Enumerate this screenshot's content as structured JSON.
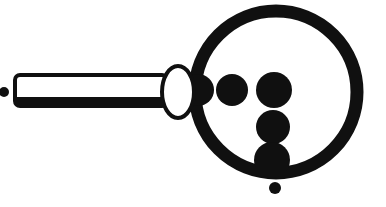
{
  "figure": {
    "alt_text": "Black and white line drawing of a magnifying glass whose lens contains six solid dots",
    "background_color": "#ffffff",
    "ink_color": "#101010",
    "canvas": {
      "width": 386,
      "height": 207
    },
    "style": "monochrome-line-art"
  },
  "lens": {
    "name": "lens-ring",
    "center_x": 276,
    "center_y": 92,
    "radius": 81,
    "stroke_width": 13,
    "fill": "none"
  },
  "ferrule": {
    "name": "ferrule-ellipse",
    "center_x": 178,
    "center_y": 92,
    "radius_x": 16,
    "radius_y": 26,
    "stroke_width": 4,
    "fill": "#ffffff"
  },
  "handle": {
    "name": "handle-bar",
    "x": 15,
    "y": 75,
    "width": 152,
    "height": 31,
    "top_stroke_width": 4,
    "bottom_stroke_width": 9,
    "fill": "#ffffff",
    "corner_radius": 5
  },
  "tip_dot": {
    "name": "handle-tip-dot",
    "center_x": 4,
    "center_y": 92,
    "radius": 5
  },
  "dots": [
    {
      "id": "dot-row-1",
      "label": "Dot 1",
      "cx": 198,
      "cy": 90,
      "r": 16
    },
    {
      "id": "dot-row-2",
      "label": "Dot 2",
      "cx": 232,
      "cy": 90,
      "r": 16
    },
    {
      "id": "dot-row-3",
      "label": "Dot 3",
      "cx": 274,
      "cy": 90,
      "r": 18
    },
    {
      "id": "dot-col-2",
      "label": "Dot 4",
      "cx": 273,
      "cy": 127,
      "r": 17
    },
    {
      "id": "dot-col-3",
      "label": "Dot 5",
      "cx": 272,
      "cy": 160,
      "r": 18
    },
    {
      "id": "dot-outside",
      "label": "Dot 6",
      "cx": 275,
      "cy": 188,
      "r": 6
    }
  ],
  "counts": {
    "total_dots": "6",
    "row_dots": "3",
    "column_dots": "3"
  }
}
